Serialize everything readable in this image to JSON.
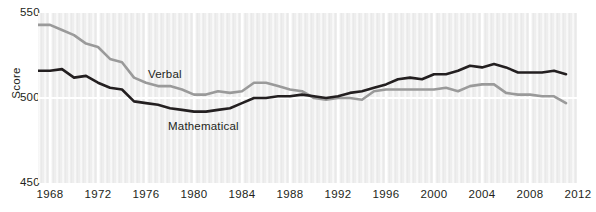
{
  "chart_data": {
    "type": "line",
    "title": "",
    "subtitle": "",
    "xlabel": "",
    "ylabel": "Score",
    "xlim": [
      1967,
      2012
    ],
    "ylim": [
      450,
      550
    ],
    "yticks": [
      450,
      500,
      550
    ],
    "xticks": [
      1968,
      1972,
      1976,
      1980,
      1984,
      1988,
      1992,
      1996,
      2000,
      2004,
      2008,
      2012
    ],
    "grid": "vertical-and-horizontal-white-on-gray",
    "legend_position": "inline-annotations",
    "x": [
      1967,
      1968,
      1969,
      1970,
      1971,
      1972,
      1973,
      1974,
      1975,
      1976,
      1977,
      1978,
      1979,
      1980,
      1981,
      1982,
      1983,
      1984,
      1985,
      1986,
      1987,
      1988,
      1989,
      1990,
      1991,
      1992,
      1993,
      1994,
      1995,
      1996,
      1997,
      1998,
      1999,
      2000,
      2001,
      2002,
      2003,
      2004,
      2005,
      2006,
      2007,
      2008,
      2009,
      2010,
      2011
    ],
    "series": [
      {
        "name": "Verbal",
        "color": "#9a9a9a",
        "values": [
          543,
          543,
          540,
          537,
          532,
          530,
          523,
          521,
          512,
          509,
          507,
          507,
          505,
          502,
          502,
          504,
          503,
          504,
          509,
          509,
          507,
          505,
          504,
          500,
          499,
          500,
          500,
          499,
          504,
          505,
          505,
          505,
          505,
          505,
          506,
          504,
          507,
          508,
          508,
          503,
          502,
          502,
          501,
          501,
          497
        ]
      },
      {
        "name": "Mathematical",
        "color": "#231f20",
        "values": [
          516,
          516,
          517,
          512,
          513,
          509,
          506,
          505,
          498,
          497,
          496,
          494,
          493,
          492,
          492,
          493,
          494,
          497,
          500,
          500,
          501,
          501,
          502,
          501,
          500,
          501,
          503,
          504,
          506,
          508,
          511,
          512,
          511,
          514,
          514,
          516,
          519,
          518,
          520,
          518,
          515,
          515,
          515,
          516,
          514
        ]
      }
    ],
    "annotations": [
      {
        "text": "Verbal",
        "x": 1976,
        "y": 511
      },
      {
        "text": "Mathematical",
        "x": 1978,
        "y": 482
      }
    ]
  },
  "axis": {
    "y_title": "Score",
    "y_ticks": {
      "top": "550",
      "mid": "500",
      "bottom": "450"
    },
    "x_tick_labels": [
      "1968",
      "1972",
      "1976",
      "1980",
      "1984",
      "1988",
      "1992",
      "1996",
      "2000",
      "2004",
      "2008",
      "2012"
    ]
  },
  "labels": {
    "verbal": "Verbal",
    "mathematical": "Mathematical"
  },
  "colors": {
    "verbal_line": "#9a9a9a",
    "mathematical_line": "#231f20",
    "plot_background": "#eeeeee",
    "gridline": "#ffffff",
    "text": "#231f20"
  }
}
